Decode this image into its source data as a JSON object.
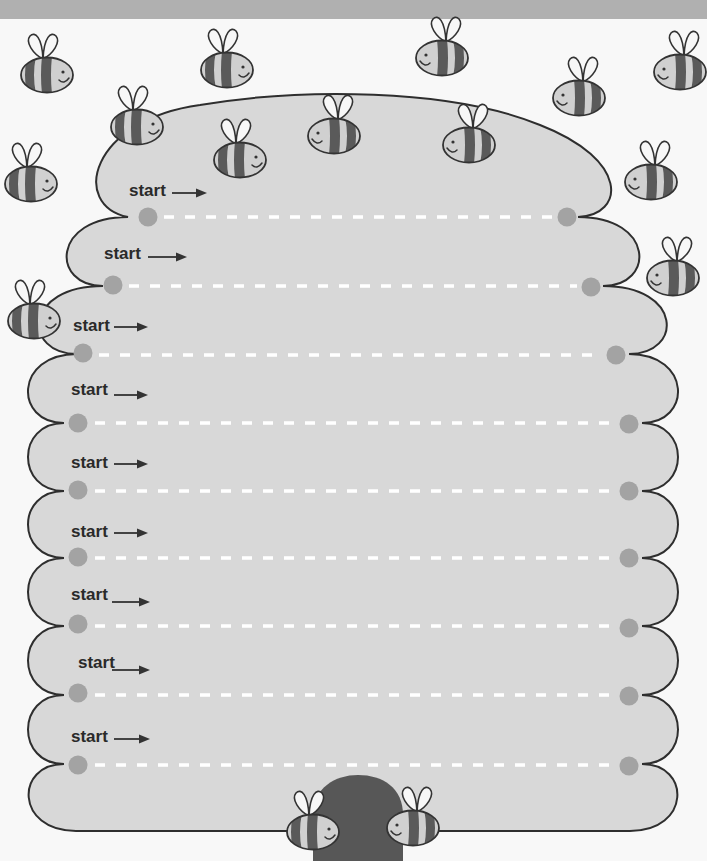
{
  "worksheet": {
    "kind": "beehive line-tracing worksheet",
    "rows": [
      {
        "label": "start",
        "arrow_icon": "right-arrow",
        "start_dot": {
          "x": 148,
          "y": 217
        },
        "end_dot": {
          "x": 567,
          "y": 217
        }
      },
      {
        "label": "start",
        "arrow_icon": "right-arrow",
        "start_dot": {
          "x": 113,
          "y": 286
        },
        "end_dot": {
          "x": 591,
          "y": 286
        }
      },
      {
        "label": "start",
        "arrow_icon": "right-arrow",
        "start_dot": {
          "x": 83,
          "y": 354
        },
        "end_dot": {
          "x": 616,
          "y": 354
        }
      },
      {
        "label": "start",
        "arrow_icon": "right-arrow",
        "start_dot": {
          "x": 78,
          "y": 423
        },
        "end_dot": {
          "x": 629,
          "y": 423
        }
      },
      {
        "label": "start",
        "arrow_icon": "right-arrow",
        "start_dot": {
          "x": 78,
          "y": 491
        },
        "end_dot": {
          "x": 629,
          "y": 491
        }
      },
      {
        "label": "start",
        "arrow_icon": "right-arrow",
        "start_dot": {
          "x": 78,
          "y": 558
        },
        "end_dot": {
          "x": 629,
          "y": 558
        }
      },
      {
        "label": "start",
        "arrow_icon": "right-arrow",
        "start_dot": {
          "x": 78,
          "y": 626
        },
        "end_dot": {
          "x": 629,
          "y": 626
        }
      },
      {
        "label": "start",
        "arrow_icon": "right-arrow",
        "start_dot": {
          "x": 78,
          "y": 695
        },
        "end_dot": {
          "x": 629,
          "y": 695
        }
      },
      {
        "label": "start",
        "arrow_icon": "right-arrow",
        "start_dot": {
          "x": 78,
          "y": 764
        },
        "end_dot": {
          "x": 629,
          "y": 764
        }
      }
    ]
  },
  "bees": [
    {
      "x": 47,
      "y": 75,
      "facing": "right"
    },
    {
      "x": 227,
      "y": 70,
      "facing": "right"
    },
    {
      "x": 137,
      "y": 127,
      "facing": "right"
    },
    {
      "x": 240,
      "y": 160,
      "facing": "right"
    },
    {
      "x": 31,
      "y": 184,
      "facing": "right"
    },
    {
      "x": 442,
      "y": 58,
      "facing": "left"
    },
    {
      "x": 334,
      "y": 136,
      "facing": "left"
    },
    {
      "x": 469,
      "y": 145,
      "facing": "left"
    },
    {
      "x": 579,
      "y": 98,
      "facing": "left"
    },
    {
      "x": 680,
      "y": 72,
      "facing": "left"
    },
    {
      "x": 651,
      "y": 182,
      "facing": "left"
    },
    {
      "x": 673,
      "y": 278,
      "facing": "left"
    },
    {
      "x": 34,
      "y": 321,
      "facing": "right"
    },
    {
      "x": 313,
      "y": 832,
      "facing": "right"
    },
    {
      "x": 413,
      "y": 828,
      "facing": "left"
    }
  ],
  "icons": {
    "bee": "bee-icon",
    "arrow": "right-arrow-icon",
    "start_dot": "start-dot",
    "end_dot": "end-dot",
    "door": "hive-door"
  },
  "colors": {
    "header_band": "#b0b0b0",
    "hive_fill": "#d8d8d8",
    "hive_outline": "#2e2e2e",
    "dot": "#a3a3a3",
    "trace_dash": "#ffffff",
    "bee_light": "#d0d0d0",
    "bee_dark": "#5a5a5a",
    "wing": "#f7f7f7",
    "door": "#575757",
    "text": "#2a2a2a"
  }
}
